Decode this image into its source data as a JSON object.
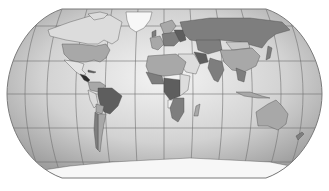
{
  "map": {
    "title": "World map",
    "projection": "Robinson",
    "colors": {
      "background": "#ffffff",
      "ocean_light": "#f2f2f2",
      "ocean_dark": "#a9a9a9",
      "graticule": "#6f6f6f",
      "outline": "#7a7a7a",
      "land_light": "#dcdcdc",
      "land_mid": "#a8a8a8",
      "land_dark": "#7e7e7e",
      "land_darker": "#5e5e5e",
      "land_darkest": "#2e2e2e",
      "ice": "#f7f7f7",
      "border": "#4a4a4a"
    },
    "regions": [
      {
        "name": "Greenland",
        "shade": "ice"
      },
      {
        "name": "Canada",
        "shade": "land_light"
      },
      {
        "name": "Alaska",
        "shade": "land_light"
      },
      {
        "name": "United States",
        "shade": "land_mid"
      },
      {
        "name": "Mexico",
        "shade": "land_light"
      },
      {
        "name": "Central America",
        "shade": "land_darkest"
      },
      {
        "name": "Cuba",
        "shade": "land_darker"
      },
      {
        "name": "Colombia",
        "shade": "land_mid"
      },
      {
        "name": "Venezuela",
        "shade": "land_mid"
      },
      {
        "name": "Brazil",
        "shade": "land_darker"
      },
      {
        "name": "Peru",
        "shade": "land_light"
      },
      {
        "name": "Bolivia",
        "shade": "land_mid"
      },
      {
        "name": "Argentina",
        "shade": "land_mid"
      },
      {
        "name": "Chile",
        "shade": "land_dark"
      },
      {
        "name": "Europe West",
        "shade": "land_mid"
      },
      {
        "name": "Europe Central",
        "shade": "land_dark"
      },
      {
        "name": "Scandinavia",
        "shade": "land_mid"
      },
      {
        "name": "Russia",
        "shade": "land_dark"
      },
      {
        "name": "Kazakhstan",
        "shade": "land_dark"
      },
      {
        "name": "Mongolia",
        "shade": "land_light"
      },
      {
        "name": "China",
        "shade": "land_mid"
      },
      {
        "name": "India",
        "shade": "land_dark"
      },
      {
        "name": "Middle East",
        "shade": "land_light"
      },
      {
        "name": "Iran",
        "shade": "land_darker"
      },
      {
        "name": "North Africa",
        "shade": "land_mid"
      },
      {
        "name": "West Africa",
        "shade": "land_dark"
      },
      {
        "name": "Central Africa",
        "shade": "land_darker"
      },
      {
        "name": "East Africa",
        "shade": "land_light"
      },
      {
        "name": "Angola",
        "shade": "land_ice"
      },
      {
        "name": "Southern Africa",
        "shade": "land_dark"
      },
      {
        "name": "Madagascar",
        "shade": "land_mid"
      },
      {
        "name": "Southeast Asia",
        "shade": "land_dark"
      },
      {
        "name": "Indonesia",
        "shade": "land_mid"
      },
      {
        "name": "Japan",
        "shade": "land_dark"
      },
      {
        "name": "Australia",
        "shade": "land_mid"
      },
      {
        "name": "New Zealand",
        "shade": "land_dark"
      },
      {
        "name": "Antarctica",
        "shade": "ice"
      }
    ]
  }
}
